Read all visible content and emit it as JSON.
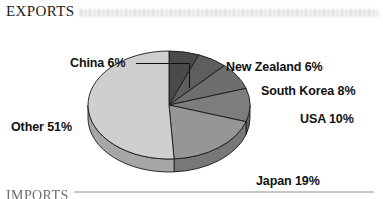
{
  "section": {
    "title": "EXPORTS",
    "smudge_icon": "blurred-scanned-text",
    "bottom_title": "IMPORTS"
  },
  "colors": {
    "china": "#4a4a4a",
    "new_zealand": "#5e5e5e",
    "south_korea": "#6e6e6e",
    "usa": "#7d7d7d",
    "japan": "#969696",
    "other": "#cfcfcf",
    "side_wall": "#a8a8a8",
    "outline": "#1a1a1a",
    "label_text": "#111111"
  },
  "labels": {
    "china": "China 6%",
    "new_zealand": "New Zealand 6%",
    "south_korea": "South Korea 8%",
    "usa": "USA 10%",
    "japan": "Japan 19%",
    "other": "Other 51%"
  },
  "chart_data": {
    "type": "pie",
    "title": "EXPORTS",
    "subtitle": "",
    "xlabel": "",
    "ylabel": "",
    "units": "percent",
    "three_d": true,
    "start_angle_clock": 12,
    "direction": "clockwise",
    "legend": "none",
    "grid": false,
    "labels_inline": true,
    "categories": [
      "China",
      "New Zealand",
      "South Korea",
      "USA",
      "Japan",
      "Other"
    ],
    "values": [
      6,
      6,
      8,
      10,
      19,
      51
    ],
    "total": 100,
    "slices": [
      {
        "name": "China",
        "value": 6,
        "label": "China 6%",
        "color": "#4a4a4a"
      },
      {
        "name": "New Zealand",
        "value": 6,
        "label": "New Zealand 6%",
        "color": "#5e5e5e"
      },
      {
        "name": "South Korea",
        "value": 8,
        "label": "South Korea 8%",
        "color": "#6e6e6e"
      },
      {
        "name": "USA",
        "value": 10,
        "label": "USA 10%",
        "color": "#7d7d7d"
      },
      {
        "name": "Japan",
        "value": 19,
        "label": "Japan 19%",
        "color": "#969696"
      },
      {
        "name": "Other",
        "value": 51,
        "label": "Other 51%",
        "color": "#cfcfcf"
      }
    ]
  }
}
